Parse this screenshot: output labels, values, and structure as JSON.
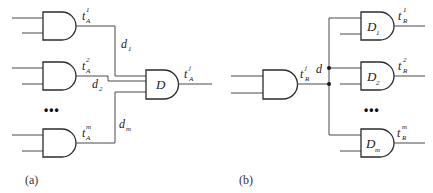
{
  "diagram_a": {
    "caption": "(a)",
    "input_gates": [
      {
        "label_base": "t",
        "label_sub": "A",
        "label_sup": "1",
        "wire_label_base": "d",
        "wire_label_sub": "1"
      },
      {
        "label_base": "t",
        "label_sub": "A",
        "label_sup": "2",
        "wire_label_base": "d",
        "wire_label_sub": "2"
      },
      {
        "label_base": "t",
        "label_sub": "A",
        "label_sup": "m",
        "wire_label_base": "d",
        "wire_label_sub": "m"
      }
    ],
    "ellipsis": "•••",
    "output_gate": {
      "label": "D",
      "out_base": "t",
      "out_sub": "A",
      "out_sup": "j"
    }
  },
  "diagram_b": {
    "caption": "(b)",
    "source_gate": {
      "out_base": "t",
      "out_sub": "R",
      "out_sup": "j"
    },
    "bus_label": "d",
    "ellipsis": "•••",
    "output_gates": [
      {
        "label_base": "D",
        "label_sub": "1",
        "out_base": "t",
        "out_sub": "R",
        "out_sup": "1"
      },
      {
        "label_base": "D",
        "label_sub": "2",
        "out_base": "t",
        "out_sub": "R",
        "out_sup": "2"
      },
      {
        "label_base": "D",
        "label_sub": "m",
        "out_base": "t",
        "out_sub": "R",
        "out_sup": "m"
      }
    ]
  },
  "colors": {
    "stroke": "#2b2b2b",
    "wire": "#4a4a4a",
    "background": "#ffffff"
  }
}
